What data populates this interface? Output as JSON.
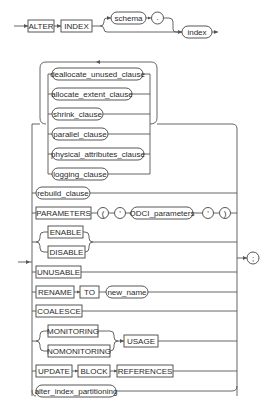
{
  "diagram": {
    "head": {
      "keyword1": "ALTER",
      "keyword2": "INDEX",
      "schema": "schema",
      "dot": ".",
      "index": "index"
    },
    "loop_items": [
      "deallocate_unused_clause",
      "allocate_extent_clause",
      "shrink_clause",
      "parallel_clause",
      "physical_attributes_clause",
      "logging_clause"
    ],
    "rows": {
      "rebuild": "rebuild_clause",
      "parameters": {
        "keyword": "PARAMETERS",
        "lparen": "(",
        "quote1": "'",
        "odci": "ODCI_parameters",
        "quote2": "'",
        "rparen": ")"
      },
      "enable": "ENABLE",
      "disable": "DISABLE",
      "unusable": "UNUSABLE",
      "rename": {
        "keyword": "RENAME",
        "to": "TO",
        "new_name": "new_name"
      },
      "coalesce": "COALESCE",
      "monitoring": "MONITORING",
      "nomonitoring": "NOMONITORING",
      "usage": "USAGE",
      "update": {
        "keyword": "UPDATE",
        "block": "BLOCK",
        "references": "REFERENCES"
      },
      "partitioning": "alter_index_partitioning"
    },
    "terminator": ";"
  }
}
